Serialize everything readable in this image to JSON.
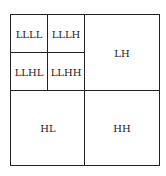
{
  "diagram": {
    "title": "",
    "regions": {
      "llll": "LLLL",
      "lllh": "LLLH",
      "llhl": "LLHL",
      "llhh": "LLHH",
      "lh": "LH",
      "hl": "HL",
      "hh": "HH"
    },
    "colors": {
      "line": "#222222",
      "background": "#ffffff",
      "text": "#222222"
    }
  }
}
